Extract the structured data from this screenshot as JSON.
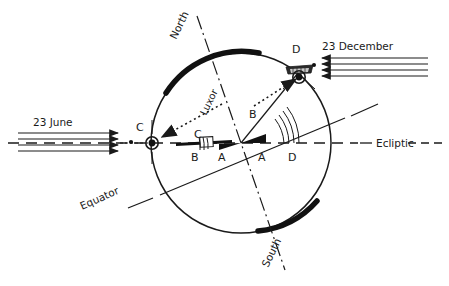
{
  "figure": {
    "title": "",
    "type": "astronomical-diagram",
    "colors": {
      "ink": "#1a1a1a",
      "stroke": "#222222",
      "fill_black": "#111111",
      "paper": "#ffffff"
    }
  },
  "labels": {
    "north": "North",
    "south": "South",
    "luxor": "Luxor",
    "equator": "Equator",
    "ecliptic": "Ecliptic",
    "june": "23 June",
    "december": "23 December",
    "point_c_outer": "C",
    "point_c_inner": "C",
    "point_d_outer": "D",
    "point_d_inner": "D",
    "angle_a_left": "A",
    "angle_a_right": "A",
    "angle_b_left": "B",
    "angle_b_right": "B"
  },
  "geometry": {
    "circle": {
      "cx": 241,
      "cy": 143,
      "r": 90
    },
    "ecliptic_y": 143,
    "axis_tilt_deg": 23.5,
    "sun_ray_count": 4
  },
  "annotations": [
    {
      "name": "june-rays",
      "text": "23 June",
      "direction": "rightward",
      "count": 4
    },
    {
      "name": "december-rays",
      "text": "23 December",
      "direction": "leftward",
      "count": 4
    },
    {
      "name": "c-marker",
      "text": "C",
      "role": "sunrise-point-june"
    },
    {
      "name": "d-marker",
      "text": "D",
      "role": "sunrise-point-december"
    }
  ]
}
